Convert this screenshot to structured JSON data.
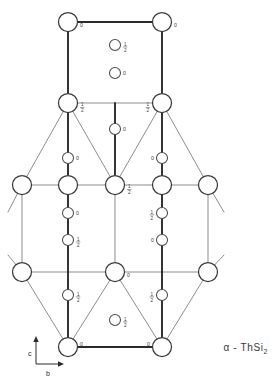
{
  "figure": {
    "title": "α - ThSi2",
    "caption_prefix": "α - ThSi",
    "caption_subscript": "2",
    "width": 280,
    "height": 383,
    "background_color": "#ffffff",
    "line_color_heavy": "#2b2b2b",
    "line_color_light": "#7a7a7a",
    "atom_fill": "#ffffff",
    "atom_stroke": "#3a3a3a"
  },
  "axes": {
    "vertical": {
      "label": "c",
      "direction": "up"
    },
    "horizontal": {
      "label": "b",
      "direction": "right"
    },
    "origin_x": 68,
    "origin_y": 347
  },
  "legend": {
    "large_atom_meaning": "Th",
    "small_atom_meaning": "Si",
    "height_unit": "fractional c"
  },
  "atoms_large": [
    {
      "id": "Th-1",
      "x": 68,
      "y": 22,
      "r": 9.5,
      "height": "0",
      "label_side": "right-below"
    },
    {
      "id": "Th-2",
      "x": 162,
      "y": 22,
      "r": 9.5,
      "height": "0",
      "label_side": "right-below"
    },
    {
      "id": "Th-3",
      "x": 68,
      "y": 103,
      "r": 9.5,
      "height": "1/2",
      "label_side": "right-below"
    },
    {
      "id": "Th-4",
      "x": 162,
      "y": 103,
      "r": 9.5,
      "height": "1/2",
      "label_side": "left-below"
    },
    {
      "id": "Th-5",
      "x": 22,
      "y": 185,
      "r": 9.5,
      "height": "",
      "label_side": "none"
    },
    {
      "id": "Th-6",
      "x": 68,
      "y": 185,
      "r": 9.5,
      "height": "",
      "label_side": "none"
    },
    {
      "id": "Th-7",
      "x": 115,
      "y": 185,
      "r": 9.5,
      "height": "1/2",
      "label_side": "right-below"
    },
    {
      "id": "Th-8",
      "x": 162,
      "y": 185,
      "r": 9.5,
      "height": "",
      "label_side": "none"
    },
    {
      "id": "Th-9",
      "x": 208,
      "y": 185,
      "r": 9.5,
      "height": "",
      "label_side": "none"
    },
    {
      "id": "Th-10",
      "x": 22,
      "y": 272,
      "r": 9.5,
      "height": "",
      "label_side": "none"
    },
    {
      "id": "Th-11",
      "x": 115,
      "y": 272,
      "r": 9.5,
      "height": "0",
      "label_side": "right-below"
    },
    {
      "id": "Th-12",
      "x": 208,
      "y": 272,
      "r": 9.5,
      "height": "",
      "label_side": "none"
    },
    {
      "id": "Th-13",
      "x": 68,
      "y": 347,
      "r": 9.5,
      "height": "0",
      "label_side": "right-above"
    },
    {
      "id": "Th-14",
      "x": 162,
      "y": 347,
      "r": 9.5,
      "height": "0",
      "label_side": "left-above"
    }
  ],
  "atoms_small": [
    {
      "id": "Si-1",
      "x": 115,
      "y": 45,
      "r": 5.5,
      "height": "1/2",
      "label_side": "right"
    },
    {
      "id": "Si-2",
      "x": 115,
      "y": 73,
      "r": 5.5,
      "height": "0",
      "label_side": "right"
    },
    {
      "id": "Si-3",
      "x": 115,
      "y": 129,
      "r": 5.5,
      "height": "0",
      "label_side": "right"
    },
    {
      "id": "Si-4",
      "x": 68,
      "y": 158,
      "r": 5.5,
      "height": "0",
      "label_side": "right"
    },
    {
      "id": "Si-5",
      "x": 162,
      "y": 158,
      "r": 5.5,
      "height": "0",
      "label_side": "left"
    },
    {
      "id": "Si-6",
      "x": 68,
      "y": 213,
      "r": 5.5,
      "height": "0",
      "label_side": "right"
    },
    {
      "id": "Si-7",
      "x": 162,
      "y": 213,
      "r": 5.5,
      "height": "1/2",
      "label_side": "left"
    },
    {
      "id": "Si-8",
      "x": 68,
      "y": 240,
      "r": 5.5,
      "height": "1/2",
      "label_side": "right"
    },
    {
      "id": "Si-9",
      "x": 162,
      "y": 240,
      "r": 5.5,
      "height": "0",
      "label_side": "left"
    },
    {
      "id": "Si-10",
      "x": 68,
      "y": 295,
      "r": 5.5,
      "height": "1/2",
      "label_side": "right"
    },
    {
      "id": "Si-11",
      "x": 162,
      "y": 295,
      "r": 5.5,
      "height": "1/2",
      "label_side": "left"
    },
    {
      "id": "Si-12",
      "x": 115,
      "y": 320,
      "r": 5.5,
      "height": "1/2",
      "label_side": "right"
    }
  ],
  "bonds_heavy": [
    {
      "x1": 68,
      "y1": 22,
      "x2": 162,
      "y2": 22
    },
    {
      "x1": 68,
      "y1": 22,
      "x2": 68,
      "y2": 103
    },
    {
      "x1": 162,
      "y1": 22,
      "x2": 162,
      "y2": 103
    },
    {
      "x1": 68,
      "y1": 103,
      "x2": 68,
      "y2": 185
    },
    {
      "x1": 162,
      "y1": 103,
      "x2": 162,
      "y2": 185
    },
    {
      "x1": 68,
      "y1": 185,
      "x2": 68,
      "y2": 272
    },
    {
      "x1": 162,
      "y1": 185,
      "x2": 162,
      "y2": 272
    },
    {
      "x1": 68,
      "y1": 272,
      "x2": 68,
      "y2": 347
    },
    {
      "x1": 162,
      "y1": 272,
      "x2": 162,
      "y2": 347
    },
    {
      "x1": 68,
      "y1": 347,
      "x2": 162,
      "y2": 347
    },
    {
      "x1": 115,
      "y1": 185,
      "x2": 115,
      "y2": 103
    }
  ],
  "bonds_light": [
    {
      "x1": 68,
      "y1": 103,
      "x2": 162,
      "y2": 103
    },
    {
      "x1": 22,
      "y1": 185,
      "x2": 208,
      "y2": 185
    },
    {
      "x1": 22,
      "y1": 272,
      "x2": 208,
      "y2": 272
    },
    {
      "x1": 68,
      "y1": 103,
      "x2": 22,
      "y2": 185
    },
    {
      "x1": 68,
      "y1": 103,
      "x2": 115,
      "y2": 185
    },
    {
      "x1": 162,
      "y1": 103,
      "x2": 115,
      "y2": 185
    },
    {
      "x1": 162,
      "y1": 103,
      "x2": 208,
      "y2": 185
    },
    {
      "x1": 22,
      "y1": 185,
      "x2": 22,
      "y2": 272
    },
    {
      "x1": 208,
      "y1": 185,
      "x2": 208,
      "y2": 272
    },
    {
      "x1": 115,
      "y1": 185,
      "x2": 115,
      "y2": 272
    },
    {
      "x1": 115,
      "y1": 272,
      "x2": 68,
      "y2": 347
    },
    {
      "x1": 115,
      "y1": 272,
      "x2": 162,
      "y2": 347
    },
    {
      "x1": 22,
      "y1": 272,
      "x2": 68,
      "y2": 347
    },
    {
      "x1": 208,
      "y1": 272,
      "x2": 162,
      "y2": 347
    },
    {
      "x1": 22,
      "y1": 185,
      "x2": 8,
      "y2": 212
    },
    {
      "x1": 208,
      "y1": 185,
      "x2": 224,
      "y2": 212
    },
    {
      "x1": 8,
      "y1": 255,
      "x2": 22,
      "y2": 272
    },
    {
      "x1": 224,
      "y1": 255,
      "x2": 208,
      "y2": 272
    }
  ]
}
